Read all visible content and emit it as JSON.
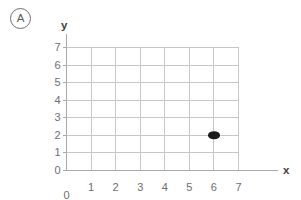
{
  "problem": {
    "label": "A",
    "icon": "circled-letter"
  },
  "chart_data": {
    "type": "scatter",
    "title": "",
    "xlabel": "x",
    "ylabel": "y",
    "xlim": [
      0,
      7
    ],
    "ylim": [
      0,
      7
    ],
    "xticks": [
      0,
      1,
      2,
      3,
      4,
      5,
      6,
      7
    ],
    "yticks": [
      0,
      1,
      2,
      3,
      4,
      5,
      6,
      7
    ],
    "xtick_labels": [
      "0",
      "1",
      "2",
      "3",
      "4",
      "5",
      "6",
      "7"
    ],
    "ytick_labels": [
      "0",
      "1",
      "2",
      "3",
      "4",
      "5",
      "6",
      "7"
    ],
    "grid": true,
    "legend": false,
    "points": [
      {
        "x": 6,
        "y": 2,
        "label": "(6, 2)"
      }
    ],
    "origin_label": "0",
    "colors": {
      "grid": "#c6c7c9",
      "axis": "#a8a9ad",
      "point": "#1a1a1a",
      "text": "#6d6e71",
      "axis_name": "#414042"
    }
  }
}
